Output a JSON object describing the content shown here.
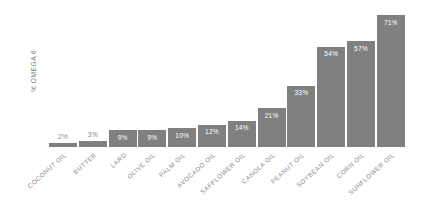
{
  "chart_data": {
    "type": "bar",
    "title": "",
    "subtitle": "",
    "xlabel": "",
    "ylabel": "% OMEGA 6",
    "ylim": [
      0,
      75
    ],
    "grid": false,
    "legend": null,
    "orientation": "vertical",
    "bar_color": "#808080",
    "value_label_color_inside": "#ffffff",
    "value_label_color_outside": "#8a8a8a",
    "axis_label_color": "#8a8a8a",
    "background": "#ffffff",
    "categories": [
      "COCONUT OIL",
      "BUTTER",
      "LARD",
      "OLIVE OIL",
      "PALM OIL",
      "AVOCADO OIL",
      "SAFFLOWER OIL",
      "CANOLA OIL",
      "PEANUT OIL",
      "SOYBEAN OIL",
      "CORN OIL",
      "SUNFLOWER OIL"
    ],
    "values": [
      2,
      3,
      9,
      9,
      10,
      12,
      14,
      21,
      33,
      54,
      57,
      71
    ],
    "value_labels": [
      "2%",
      "3%",
      "9%",
      "9%",
      "10%",
      "12%",
      "14%",
      "21%",
      "33%",
      "54%",
      "57%",
      "71%"
    ],
    "label_placement": [
      "outside",
      "outside",
      "inside",
      "inside",
      "inside",
      "inside",
      "inside",
      "inside",
      "inside",
      "inside",
      "inside",
      "inside"
    ]
  }
}
